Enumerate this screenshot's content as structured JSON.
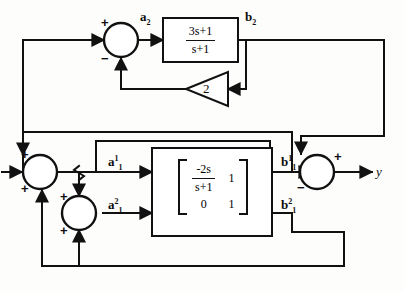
{
  "diagram": {
    "background_color": "#fdfdfb",
    "line_color": "#111111"
  },
  "signals": {
    "a2": "a",
    "a2_sub": "2",
    "b2": "b",
    "b2_sub": "2",
    "a11_base": "a",
    "a11_sup": "1",
    "a11_sub": "1",
    "a12_base": "a",
    "a12_sup": "2",
    "a12_sub": "1",
    "b11_base": "b",
    "b11_sup": "1",
    "b11_sub": "1",
    "b12_base": "b",
    "b12_sup": "2",
    "b12_sub": "1",
    "output": "y"
  },
  "blocks": {
    "top_transfer_function": {
      "numerator": "3s+1",
      "denominator": "s+1"
    },
    "gain": {
      "value": "2"
    },
    "matrix": {
      "r0c0_numerator": "-2s",
      "r0c0_denominator": "s+1",
      "r0c1": "1",
      "r1c0": "0",
      "r1c1": "1"
    }
  },
  "summers": {
    "top": {
      "plus": "+",
      "minus": "−"
    },
    "left_upper": {
      "plus_top": "+",
      "plus_bottom": "+"
    },
    "left_lower": {
      "plus_top": "+",
      "plus_bottom": "+"
    },
    "output": {
      "plus": "+",
      "minus": "−"
    }
  }
}
